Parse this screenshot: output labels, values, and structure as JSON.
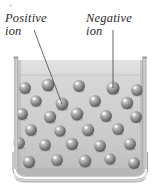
{
  "figure": {
    "background_color": "#ffffff"
  },
  "labels": [
    {
      "id": "positive",
      "text": "Positive\nion",
      "x": 5,
      "y": 12,
      "leader": {
        "x1": 34,
        "y1": 30,
        "x2": 62,
        "y2": 104
      }
    },
    {
      "id": "negative",
      "text": "Negative\nion",
      "x": 86,
      "y": 12,
      "leader": {
        "x1": 113,
        "y1": 30,
        "x2": 113,
        "y2": 88
      }
    }
  ],
  "container": {
    "name": "beaker",
    "left_wall_x": 14,
    "right_wall_x": 147,
    "top_y": 58,
    "bottom_y": 178,
    "wall_color": "#b9b9b9",
    "fluid_color": "#d2d2d2",
    "fluid_surface_y": 75,
    "rim_color": "#e8e8e8"
  },
  "particles": {
    "color": "#8a8a8a",
    "highlight_color": "#f2f2f2",
    "shadow_color": "#4a4a4a",
    "radius": 6.2,
    "count": 27,
    "positions": [
      {
        "x": 25,
        "y": 88,
        "r": 6.0
      },
      {
        "x": 48,
        "y": 85,
        "r": 6.3
      },
      {
        "x": 79,
        "y": 86,
        "r": 6.0
      },
      {
        "x": 113,
        "y": 88,
        "r": 6.6,
        "labeled": "negative"
      },
      {
        "x": 137,
        "y": 90,
        "r": 6.0
      },
      {
        "x": 36,
        "y": 101,
        "r": 5.8
      },
      {
        "x": 62,
        "y": 104,
        "r": 6.4,
        "labeled": "positive"
      },
      {
        "x": 95,
        "y": 101,
        "r": 6.0
      },
      {
        "x": 127,
        "y": 103,
        "r": 6.2
      },
      {
        "x": 22,
        "y": 114,
        "r": 6.0
      },
      {
        "x": 50,
        "y": 117,
        "r": 6.2
      },
      {
        "x": 77,
        "y": 114,
        "r": 6.4
      },
      {
        "x": 106,
        "y": 116,
        "r": 6.0
      },
      {
        "x": 136,
        "y": 117,
        "r": 6.0
      },
      {
        "x": 31,
        "y": 130,
        "r": 6.0
      },
      {
        "x": 60,
        "y": 131,
        "r": 5.8
      },
      {
        "x": 88,
        "y": 130,
        "r": 6.2
      },
      {
        "x": 118,
        "y": 129,
        "r": 6.0
      },
      {
        "x": 19,
        "y": 143,
        "r": 6.0
      },
      {
        "x": 45,
        "y": 145,
        "r": 6.0
      },
      {
        "x": 72,
        "y": 144,
        "r": 6.2
      },
      {
        "x": 100,
        "y": 146,
        "r": 6.0
      },
      {
        "x": 130,
        "y": 144,
        "r": 6.0
      },
      {
        "x": 29,
        "y": 162,
        "r": 6.2
      },
      {
        "x": 57,
        "y": 160,
        "r": 6.0
      },
      {
        "x": 85,
        "y": 161,
        "r": 6.4
      },
      {
        "x": 110,
        "y": 159,
        "r": 5.8
      },
      {
        "x": 134,
        "y": 163,
        "r": 6.0
      }
    ]
  }
}
